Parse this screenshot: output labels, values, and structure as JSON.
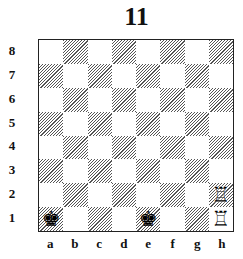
{
  "title": "11",
  "ranks": [
    "8",
    "7",
    "6",
    "5",
    "4",
    "3",
    "2",
    "1"
  ],
  "files": [
    "a",
    "b",
    "c",
    "d",
    "e",
    "f",
    "g",
    "h"
  ],
  "pieces": {
    "a1": {
      "name": "black-king",
      "glyph": "♚",
      "color": "black"
    },
    "e1": {
      "name": "black-king",
      "glyph": "♚",
      "color": "black"
    },
    "h2": {
      "name": "white-rook",
      "glyph": "♖",
      "color": "white"
    },
    "h1": {
      "name": "white-rook",
      "glyph": "♖",
      "color": "white"
    }
  },
  "colors": {
    "hatch": "#555555",
    "light": "#ffffff",
    "border": "#222222"
  }
}
